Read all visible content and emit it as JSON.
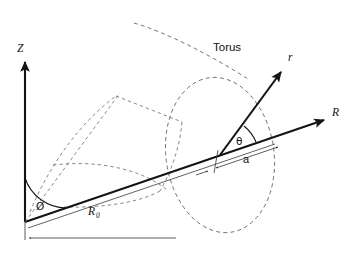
{
  "figure": {
    "type": "technical-line-diagram",
    "background_color": "#ffffff",
    "line_color": "#141414",
    "dashed_color": "#5d5d66",
    "width": 359,
    "height": 255
  },
  "labels": {
    "z_axis": "Z",
    "r_axis_major": "R",
    "r_vector_minor": "r",
    "torus": "Torus",
    "theta": "θ",
    "phi": "Ø",
    "minor_radius": "a",
    "major_radius": "R",
    "major_radius_subscript": "0"
  },
  "geometry": {
    "origin": {
      "x": 25,
      "y": 222
    },
    "z_axis_tip": {
      "x": 25,
      "y": 58
    },
    "r_axis_tip": {
      "x": 329,
      "y": 118
    },
    "torus_center": {
      "x": 220,
      "y": 155
    },
    "r_vector_tip": {
      "x": 285,
      "y": 68
    },
    "cross_section_ellipse": {
      "cx": 220,
      "cy": 155,
      "rx": 54,
      "ry": 78,
      "rotation_deg": -8
    },
    "phi_angle_label_pos": {
      "x": 40,
      "y": 206
    },
    "theta_angle_label_pos": {
      "x": 240,
      "y": 141
    }
  },
  "annotations": {
    "dimension_major_radius": "R₀",
    "dimension_minor_radius": "a",
    "angle_in_plane": "Ø",
    "angle_poloidal": "θ"
  }
}
